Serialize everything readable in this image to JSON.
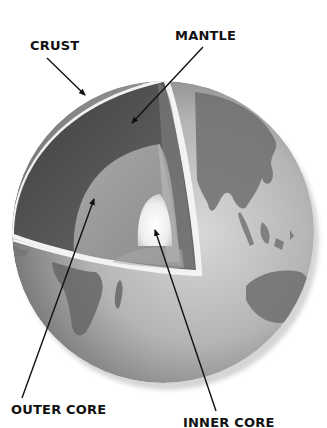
{
  "diagram": {
    "labels": {
      "crust": "CRUST",
      "mantle": "MANTLE",
      "outer_core": "OUTER CORE",
      "inner_core": "INNER CORE"
    },
    "colors": {
      "background": "#ffffff",
      "label_text": "#111111",
      "arrow": "#111111",
      "mantle": "#5a5a5a",
      "outer_core": "#9a9a9a",
      "inner_core": "#f4f4f4",
      "globe_surface": "#b8b8b8",
      "continents": "#6e6e6e",
      "cut_rim": "#f2f2f2"
    },
    "continents_visible": [
      "Africa",
      "Madagascar",
      "Asia",
      "India",
      "Southeast Asia",
      "Australia"
    ]
  }
}
